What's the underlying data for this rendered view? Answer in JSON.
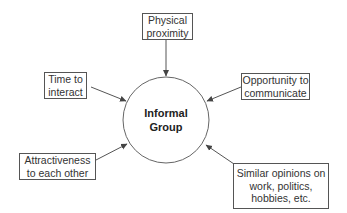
{
  "diagram": {
    "type": "hub-and-spoke",
    "center": {
      "lines": [
        "Informal",
        "Group"
      ],
      "shape": "circle"
    },
    "factors": [
      {
        "id": "physical-proximity",
        "lines": [
          "Physical",
          "proximity"
        ],
        "position": "top"
      },
      {
        "id": "time-to-interact",
        "lines": [
          "Time to",
          "interact"
        ],
        "position": "upper-left"
      },
      {
        "id": "opportunity-to-communicate",
        "lines": [
          "Opportunity to",
          "communicate"
        ],
        "position": "upper-right"
      },
      {
        "id": "attractiveness",
        "lines": [
          "Attractiveness",
          "to each other"
        ],
        "position": "lower-left"
      },
      {
        "id": "similar-opinions",
        "lines": [
          "Similar opinions on",
          "work, politics,",
          "hobbies, etc."
        ],
        "position": "lower-right"
      }
    ],
    "edge_direction": "factor-to-center",
    "colors": {
      "line": "#555555",
      "text": "#333333",
      "background": "#ffffff"
    }
  }
}
